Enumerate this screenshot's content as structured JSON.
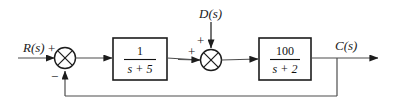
{
  "diagram": {
    "type": "control-system-block-diagram",
    "background_color": "#ffffff",
    "line_color": "#4d4d4d",
    "block_border_color": "#1c1c1c",
    "text_color": "#111111",
    "signals": {
      "reference_input": "R(s)",
      "disturbance_input": "D(s)",
      "output": "C(s)"
    },
    "summing_junctions": [
      {
        "id": "summer-1",
        "name": "error-summing-junction",
        "cx": 65,
        "cy": 58,
        "r": 10.5,
        "signs": [
          {
            "label": "+",
            "position": "top-left",
            "x": 48,
            "y": 50
          },
          {
            "label": "−",
            "position": "bottom-left",
            "x": 53,
            "y": 78
          }
        ]
      },
      {
        "id": "summer-2",
        "name": "disturbance-summing-junction",
        "cx": 211,
        "cy": 60,
        "r": 10.5,
        "signs": [
          {
            "label": "+",
            "position": "top",
            "x": 196,
            "y": 44
          },
          {
            "label": "+",
            "position": "left",
            "x": 189,
            "y": 54
          }
        ]
      }
    ],
    "blocks": [
      {
        "id": "block-1",
        "name": "plant-block-1",
        "numerator": "1",
        "denominator": "s + 5",
        "transfer_function": "1/(s + 5)",
        "x": 113,
        "y": 38,
        "width": 54,
        "height": 42
      },
      {
        "id": "block-2",
        "name": "plant-block-2",
        "numerator": "100",
        "denominator": "s + 2",
        "transfer_function": "100/(s + 2)",
        "x": 259,
        "y": 38,
        "width": 52,
        "height": 42
      }
    ],
    "feedback": {
      "name": "unity-feedback-path",
      "takeoff_x": 337,
      "line_y": 96,
      "return_x": 65,
      "gain": "1"
    }
  }
}
